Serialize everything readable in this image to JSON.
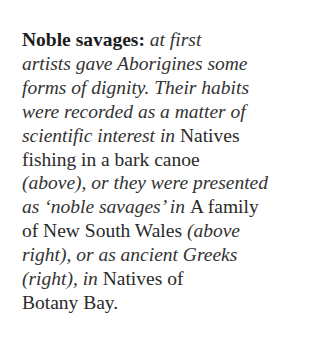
{
  "caption": {
    "heading": "Noble savages:",
    "lines": [
      [
        {
          "style": "bold",
          "text": "Noble savages: "
        },
        {
          "style": "it",
          "text": "at first"
        }
      ],
      [
        {
          "style": "it",
          "text": "artists gave Aborigines some"
        }
      ],
      [
        {
          "style": "it",
          "text": "forms of dignity. Their habits"
        }
      ],
      [
        {
          "style": "it",
          "text": "were recorded as a matter of"
        }
      ],
      [
        {
          "style": "it",
          "text": "scientific interest in "
        },
        {
          "style": "rm",
          "text": "Natives"
        }
      ],
      [
        {
          "style": "rm",
          "text": "fishing in a bark canoe"
        }
      ],
      [
        {
          "style": "it",
          "text": "(above), or they were presented"
        }
      ],
      [
        {
          "style": "it",
          "text": "as ‘noble savages’ in "
        },
        {
          "style": "rm",
          "text": "A family"
        }
      ],
      [
        {
          "style": "rm",
          "text": "of New South Wales "
        },
        {
          "style": "it",
          "text": "(above"
        }
      ],
      [
        {
          "style": "it",
          "text": "right), or as ancient Greeks"
        }
      ],
      [
        {
          "style": "it",
          "text": "(right), in "
        },
        {
          "style": "rm",
          "text": "Natives of"
        }
      ],
      [
        {
          "style": "rm",
          "text": "Botany Bay."
        }
      ]
    ]
  },
  "referenced_works": [
    "Natives fishing in a bark canoe",
    "A family of New South Wales",
    "Natives of Botany Bay"
  ]
}
